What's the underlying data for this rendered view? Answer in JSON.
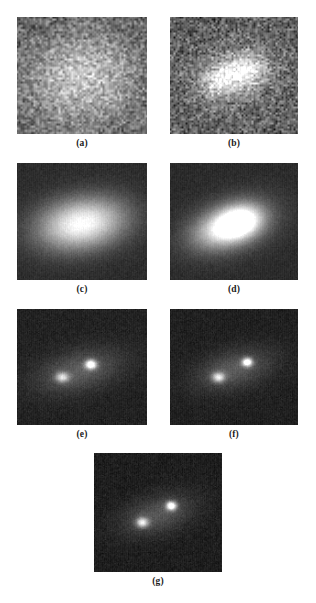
{
  "figure": {
    "type": "multi-panel-grayscale-image-figure",
    "width": 316,
    "height": 603,
    "background": "#ffffff",
    "caption_color": "#1a1a1a",
    "layout": "2-2-2-1",
    "panels": [
      {
        "id": "a",
        "caption": "(a)",
        "x": 17,
        "y": 17,
        "w": 130,
        "h": 117,
        "caption_x": 17,
        "caption_y": 138,
        "caption_w": 130,
        "description": "heavily noisy blurred image, single broad bright blob near center",
        "noise_sigma": 52,
        "noise_grain": 2.1,
        "base_level": 96,
        "blobs": [
          {
            "cx": 0.5,
            "cy": 0.52,
            "sx": 0.3,
            "sy": 0.28,
            "amp": 105,
            "angle": -18
          }
        ]
      },
      {
        "id": "b",
        "caption": "(b)",
        "x": 170,
        "y": 17,
        "w": 128,
        "h": 117,
        "caption_x": 170,
        "caption_y": 138,
        "caption_w": 128,
        "description": "noisy image with two partially separated bright regions",
        "noise_sigma": 50,
        "noise_grain": 2.0,
        "base_level": 92,
        "blobs": [
          {
            "cx": 0.585,
            "cy": 0.455,
            "sx": 0.115,
            "sy": 0.1,
            "amp": 120,
            "angle": -20
          },
          {
            "cx": 0.375,
            "cy": 0.545,
            "sx": 0.105,
            "sy": 0.09,
            "amp": 96,
            "angle": -20
          },
          {
            "cx": 0.49,
            "cy": 0.51,
            "sx": 0.3,
            "sy": 0.24,
            "amp": 42,
            "angle": -20
          }
        ]
      },
      {
        "id": "c",
        "caption": "(c)",
        "x": 17,
        "y": 163,
        "w": 130,
        "h": 117,
        "caption_x": 17,
        "caption_y": 284,
        "caption_w": 130,
        "description": "smooth single elongated bright Gaussian blob on dark noisy background",
        "noise_sigma": 9,
        "noise_grain": 1.2,
        "base_level": 44,
        "blobs": [
          {
            "cx": 0.495,
            "cy": 0.515,
            "sx": 0.235,
            "sy": 0.15,
            "amp": 215,
            "angle": -12
          }
        ]
      },
      {
        "id": "d",
        "caption": "(d)",
        "x": 170,
        "y": 163,
        "w": 128,
        "h": 117,
        "caption_x": 170,
        "caption_y": 284,
        "caption_w": 128,
        "description": "smooth blob slightly elongated along diagonal, brighter core right of center",
        "noise_sigma": 9,
        "noise_grain": 1.2,
        "base_level": 42,
        "blobs": [
          {
            "cx": 0.545,
            "cy": 0.5,
            "sx": 0.125,
            "sy": 0.095,
            "amp": 200,
            "angle": -22
          },
          {
            "cx": 0.4,
            "cy": 0.56,
            "sx": 0.165,
            "sy": 0.105,
            "amp": 120,
            "angle": -22
          },
          {
            "cx": 0.48,
            "cy": 0.53,
            "sx": 0.265,
            "sy": 0.16,
            "amp": 70,
            "angle": -22
          }
        ]
      },
      {
        "id": "e",
        "caption": "(e)",
        "x": 17,
        "y": 309,
        "w": 130,
        "h": 116,
        "caption_x": 17,
        "caption_y": 429,
        "caption_w": 130,
        "description": "two resolved point sources with faint halo, dark background",
        "noise_sigma": 11,
        "noise_grain": 1.1,
        "base_level": 34,
        "blobs": [
          {
            "cx": 0.565,
            "cy": 0.475,
            "sx": 0.03,
            "sy": 0.028,
            "amp": 230,
            "angle": 0
          },
          {
            "cx": 0.345,
            "cy": 0.585,
            "sx": 0.036,
            "sy": 0.03,
            "amp": 150,
            "angle": 0
          },
          {
            "cx": 0.475,
            "cy": 0.53,
            "sx": 0.23,
            "sy": 0.115,
            "amp": 62,
            "angle": -17
          }
        ]
      },
      {
        "id": "f",
        "caption": "(f)",
        "x": 170,
        "y": 309,
        "w": 128,
        "h": 116,
        "caption_x": 170,
        "caption_y": 429,
        "caption_w": 128,
        "description": "two sharply resolved point sources, slightly brighter than (e)",
        "noise_sigma": 11,
        "noise_grain": 1.1,
        "base_level": 32,
        "blobs": [
          {
            "cx": 0.6,
            "cy": 0.455,
            "sx": 0.028,
            "sy": 0.026,
            "amp": 238,
            "angle": 0
          },
          {
            "cx": 0.375,
            "cy": 0.585,
            "sx": 0.034,
            "sy": 0.03,
            "amp": 168,
            "angle": 0
          },
          {
            "cx": 0.495,
            "cy": 0.52,
            "sx": 0.215,
            "sy": 0.11,
            "amp": 60,
            "angle": -18
          }
        ]
      },
      {
        "id": "g",
        "caption": "(g)",
        "x": 94,
        "y": 453,
        "w": 128,
        "h": 119,
        "caption_x": 94,
        "caption_y": 576,
        "caption_w": 128,
        "description": "two sharply resolved point sources on very dark noisy background",
        "noise_sigma": 12,
        "noise_grain": 1.1,
        "base_level": 30,
        "blobs": [
          {
            "cx": 0.6,
            "cy": 0.44,
            "sx": 0.028,
            "sy": 0.026,
            "amp": 235,
            "angle": 0
          },
          {
            "cx": 0.375,
            "cy": 0.58,
            "sx": 0.033,
            "sy": 0.029,
            "amp": 175,
            "angle": 0
          },
          {
            "cx": 0.495,
            "cy": 0.515,
            "sx": 0.205,
            "sy": 0.105,
            "amp": 58,
            "angle": -18
          }
        ]
      }
    ]
  }
}
